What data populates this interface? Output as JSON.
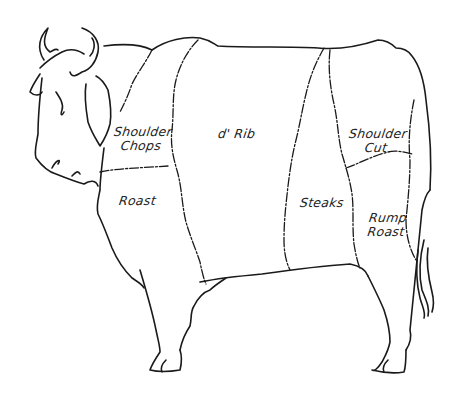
{
  "diagram": {
    "style": "hand-drawn line sketch",
    "line_color": "#1a1a1a",
    "background": "#ffffff",
    "cuts": [
      {
        "id": "shoulder-chops",
        "line1": "Shoulder",
        "line2": "Chops"
      },
      {
        "id": "roast",
        "line1": "Roast",
        "line2": ""
      },
      {
        "id": "d-rib",
        "line1": "d' Rib",
        "line2": ""
      },
      {
        "id": "steaks",
        "line1": "Steaks",
        "line2": ""
      },
      {
        "id": "shoulder-cut",
        "line1": "Shoulder",
        "line2": "Cut"
      },
      {
        "id": "rump-roast",
        "line1": "Rump",
        "line2": "Roast"
      }
    ]
  }
}
